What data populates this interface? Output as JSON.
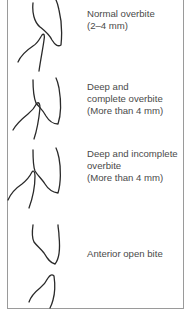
{
  "figure": {
    "stroke_color": "#2a2a2a",
    "text_color": "#4a4a4a",
    "frame_color": "#9a9a9a",
    "panels": [
      {
        "id": "normal",
        "label_lines": [
          "Normal overbite",
          "(2–4 mm)"
        ],
        "upper_tooth_icon": "upper-incisor-outline",
        "lower_tooth_icon": "lower-incisor-outline"
      },
      {
        "id": "deep-complete",
        "label_lines": [
          "Deep and",
          "complete overbite",
          "(More than 4 mm)"
        ],
        "upper_tooth_icon": "upper-incisor-outline",
        "lower_tooth_icon": "lower-incisor-outline"
      },
      {
        "id": "deep-incomplete",
        "label_lines": [
          "Deep and incomplete",
          "overbite",
          "(More than 4 mm)"
        ],
        "upper_tooth_icon": "upper-incisor-outline",
        "lower_tooth_icon": "lower-incisor-outline"
      },
      {
        "id": "open-bite",
        "label_lines": [
          "Anterior open bite"
        ],
        "upper_tooth_icon": "upper-incisor-outline",
        "lower_tooth_icon": "lower-incisor-outline"
      }
    ]
  }
}
